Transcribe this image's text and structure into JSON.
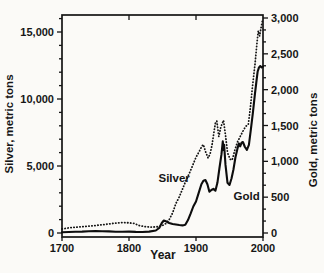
{
  "figure": {
    "background": "#fbfaf7",
    "ink": "#141414"
  },
  "chart_data": {
    "type": "line",
    "title": "",
    "xlabel": "Year",
    "ylabel_left": "Silver, metric tons",
    "ylabel_right": "Gold, metric tons",
    "grid": false,
    "x_range": [
      1700,
      2000
    ],
    "x_tick_years": [
      1700,
      1800,
      1900,
      2000
    ],
    "x_tick_labels": [
      "1700",
      "1800",
      "1900",
      "2000"
    ],
    "x_top_tick_years": [
      1800,
      1900
    ],
    "left_axis": {
      "range": [
        0,
        15000
      ],
      "major_tick_values": [
        0,
        5000,
        10000,
        15000
      ],
      "major_tick_labels": [
        "0",
        "5,000",
        "10,000",
        "15,000"
      ],
      "minor_step": 1000,
      "minor_max": 16000
    },
    "right_axis": {
      "range": [
        0,
        3000
      ],
      "major_tick_values": [
        0,
        500,
        1000,
        1500,
        2000,
        2500,
        3000
      ],
      "major_tick_labels": [
        "0",
        "500",
        "1,000",
        "1,500",
        "2,000",
        "2,500",
        "3,000"
      ],
      "minors_per_major": 2
    },
    "series": [
      {
        "name": "Silver",
        "axis": "left",
        "style": "dotted",
        "label": {
          "text": "Silver",
          "year": 1844,
          "value": 4100
        },
        "points": [
          [
            1700,
            300
          ],
          [
            1710,
            380
          ],
          [
            1720,
            430
          ],
          [
            1730,
            470
          ],
          [
            1740,
            510
          ],
          [
            1750,
            560
          ],
          [
            1760,
            610
          ],
          [
            1770,
            670
          ],
          [
            1780,
            740
          ],
          [
            1790,
            780
          ],
          [
            1800,
            760
          ],
          [
            1808,
            710
          ],
          [
            1815,
            560
          ],
          [
            1825,
            460
          ],
          [
            1835,
            440
          ],
          [
            1845,
            480
          ],
          [
            1850,
            560
          ],
          [
            1855,
            700
          ],
          [
            1860,
            1000
          ],
          [
            1865,
            1500
          ],
          [
            1870,
            2200
          ],
          [
            1875,
            2700
          ],
          [
            1880,
            3300
          ],
          [
            1885,
            3900
          ],
          [
            1890,
            4450
          ],
          [
            1895,
            5050
          ],
          [
            1900,
            5650
          ],
          [
            1905,
            6100
          ],
          [
            1909,
            6500
          ],
          [
            1911,
            6600
          ],
          [
            1914,
            6100
          ],
          [
            1918,
            5600
          ],
          [
            1921,
            5900
          ],
          [
            1924,
            6600
          ],
          [
            1927,
            7600
          ],
          [
            1929,
            8200
          ],
          [
            1931,
            8350
          ],
          [
            1934,
            7200
          ],
          [
            1937,
            7900
          ],
          [
            1941,
            8400
          ],
          [
            1944,
            7300
          ],
          [
            1947,
            6000
          ],
          [
            1951,
            5500
          ],
          [
            1954,
            5450
          ],
          [
            1958,
            6200
          ],
          [
            1962,
            6800
          ],
          [
            1966,
            7200
          ],
          [
            1970,
            7600
          ],
          [
            1974,
            7950
          ],
          [
            1978,
            8100
          ],
          [
            1981,
            9300
          ],
          [
            1984,
            10800
          ],
          [
            1988,
            12600
          ],
          [
            1991,
            14200
          ],
          [
            1993,
            15100
          ],
          [
            1995,
            14700
          ],
          [
            1997,
            15300
          ],
          [
            1999,
            15800
          ],
          [
            2000,
            15800
          ]
        ]
      },
      {
        "name": "Gold",
        "axis": "right",
        "style": "solid",
        "label": {
          "text": "Gold",
          "year": 1956,
          "value": 520
        },
        "points": [
          [
            1700,
            10
          ],
          [
            1710,
            14
          ],
          [
            1720,
            18
          ],
          [
            1730,
            20
          ],
          [
            1740,
            24
          ],
          [
            1750,
            26
          ],
          [
            1760,
            25
          ],
          [
            1770,
            22
          ],
          [
            1780,
            18
          ],
          [
            1790,
            17
          ],
          [
            1800,
            20
          ],
          [
            1810,
            16
          ],
          [
            1820,
            14
          ],
          [
            1830,
            20
          ],
          [
            1840,
            35
          ],
          [
            1845,
            70
          ],
          [
            1849,
            140
          ],
          [
            1852,
            175
          ],
          [
            1856,
            160
          ],
          [
            1860,
            140
          ],
          [
            1865,
            125
          ],
          [
            1870,
            118
          ],
          [
            1875,
            112
          ],
          [
            1880,
            106
          ],
          [
            1884,
            115
          ],
          [
            1888,
            180
          ],
          [
            1892,
            270
          ],
          [
            1896,
            370
          ],
          [
            1900,
            440
          ],
          [
            1904,
            560
          ],
          [
            1908,
            680
          ],
          [
            1911,
            730
          ],
          [
            1914,
            740
          ],
          [
            1917,
            680
          ],
          [
            1920,
            575
          ],
          [
            1923,
            600
          ],
          [
            1926,
            615
          ],
          [
            1929,
            590
          ],
          [
            1932,
            700
          ],
          [
            1935,
            900
          ],
          [
            1938,
            1100
          ],
          [
            1940,
            1280
          ],
          [
            1941,
            1160
          ],
          [
            1942,
            1230
          ],
          [
            1944,
            950
          ],
          [
            1947,
            700
          ],
          [
            1950,
            670
          ],
          [
            1953,
            760
          ],
          [
            1956,
            890
          ],
          [
            1959,
            1060
          ],
          [
            1962,
            1180
          ],
          [
            1964,
            1250
          ],
          [
            1966,
            1210
          ],
          [
            1968,
            1260
          ],
          [
            1970,
            1270
          ],
          [
            1973,
            1200
          ],
          [
            1976,
            1160
          ],
          [
            1979,
            1230
          ],
          [
            1982,
            1450
          ],
          [
            1985,
            1680
          ],
          [
            1988,
            1950
          ],
          [
            1990,
            2100
          ],
          [
            1992,
            2250
          ],
          [
            1994,
            2310
          ],
          [
            1996,
            2330
          ],
          [
            1998,
            2310
          ],
          [
            2000,
            2320
          ]
        ]
      }
    ]
  }
}
